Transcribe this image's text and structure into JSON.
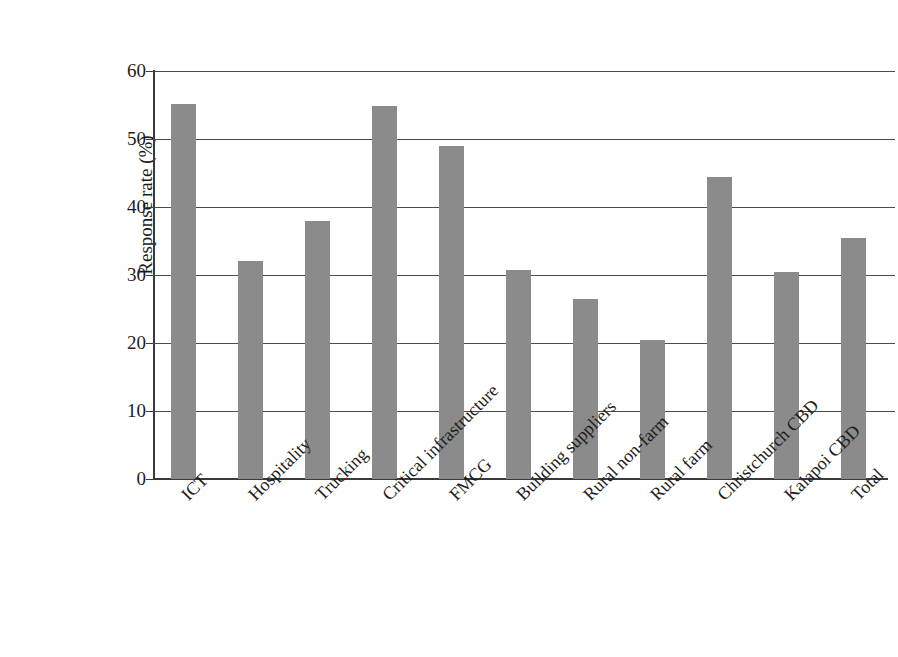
{
  "chart_data": {
    "type": "bar",
    "title": "",
    "subtitle": "",
    "xlabel": "",
    "ylabel": "Response rate (%)",
    "ylim": [
      0,
      60
    ],
    "ytick_step": 10,
    "yticks": [
      "0",
      "10",
      "20",
      "30",
      "40",
      "50",
      "60"
    ],
    "grid": "horizontal",
    "legend": "none",
    "bar_color": "#8b8b8b",
    "axis_color": "#3a3a3a",
    "label_rotation_deg": -45,
    "categories": [
      "ICT",
      "Hospitality",
      "Trucking",
      "Critical infrastructure",
      "FMCG",
      "Building suppliers",
      "Rural non-farm",
      "Rural farm",
      "Christchurch CBD",
      "Kaiapoi CBD",
      "Total"
    ],
    "values": [
      55.1,
      32.1,
      38.0,
      54.8,
      48.9,
      30.7,
      26.5,
      20.4,
      44.4,
      30.5,
      35.4
    ]
  },
  "bleed_through": {
    "note": "faint show-through text from the reverse side of the printed page",
    "lines": [
      "",
      "",
      "",
      "",
      "",
      "",
      "",
      "",
      "",
      "",
      "",
      "",
      "",
      "",
      "",
      ""
    ]
  }
}
